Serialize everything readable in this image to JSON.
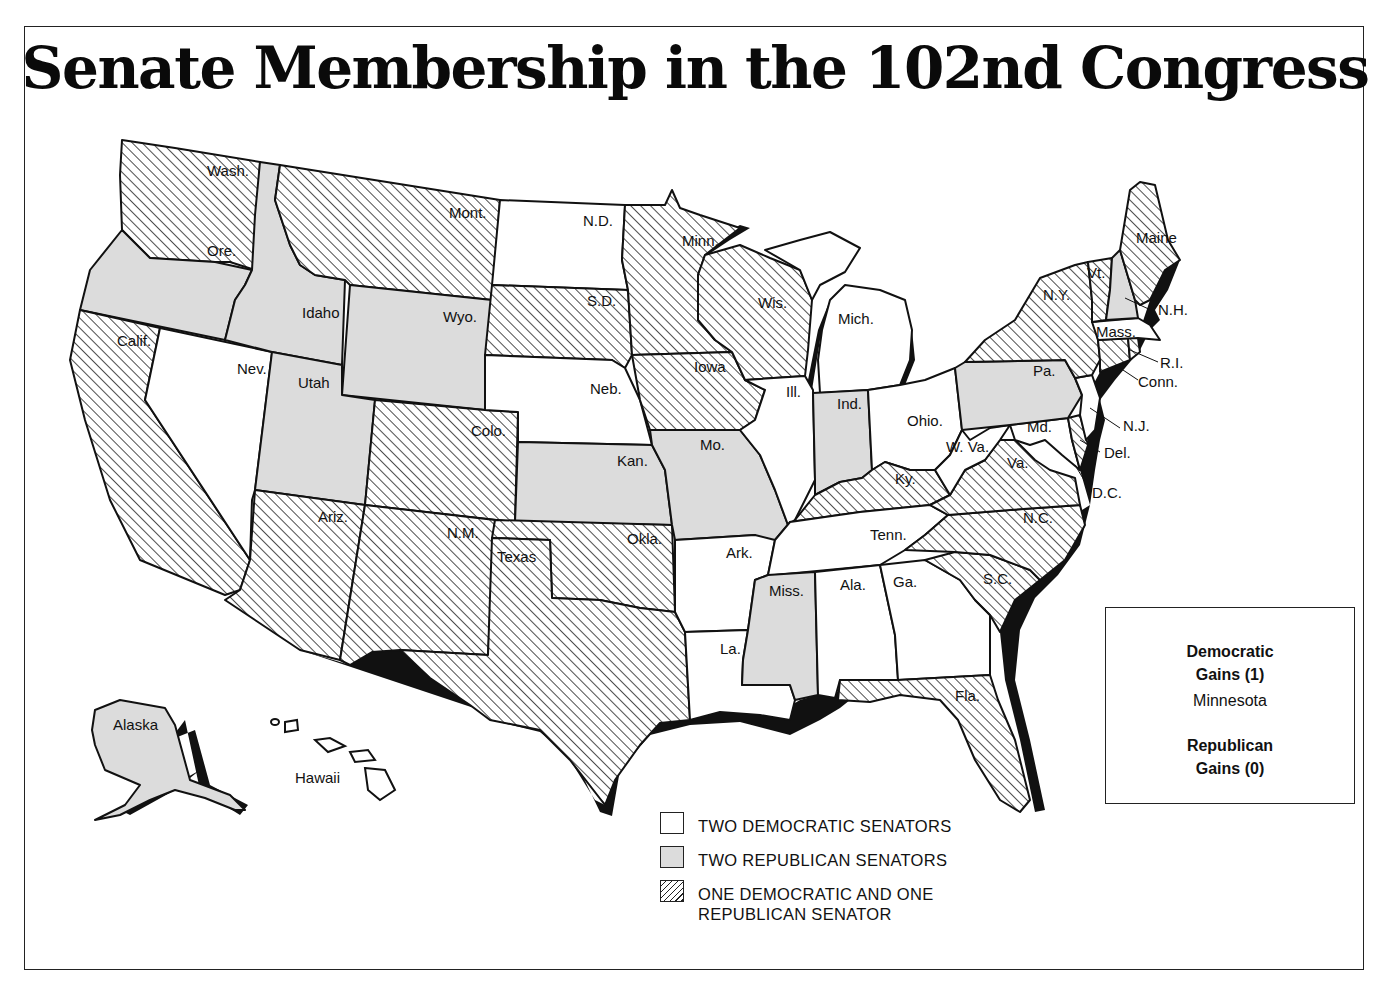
{
  "title": "Senate Membership in the 102nd Congress",
  "legend": {
    "items": [
      {
        "key": "two_dem",
        "label": "TWO DEMOCRATIC SENATORS",
        "fill": "white"
      },
      {
        "key": "two_rep",
        "label": "TWO REPUBLICAN SENATORS",
        "fill": "#dcdcdc"
      },
      {
        "key": "split",
        "label_line1": "ONE DEMOCRATIC AND ONE",
        "label_line2": "REPUBLICAN SENATOR",
        "fill": "hatched"
      }
    ]
  },
  "gains": {
    "democratic_heading_1": "Democratic",
    "democratic_heading_2": "Gains (1)",
    "democratic_states": "Minnesota",
    "republican_heading_1": "Republican",
    "republican_heading_2": "Gains (0)"
  },
  "colors": {
    "two_dem": "#ffffff",
    "two_rep": "#dcdcdc",
    "split_hatch": "#222222",
    "outline": "#111111"
  },
  "states": [
    {
      "abbr": "Wash.",
      "status": "split"
    },
    {
      "abbr": "Ore.",
      "status": "two_rep"
    },
    {
      "abbr": "Calif.",
      "status": "split"
    },
    {
      "abbr": "Nev.",
      "status": "two_dem"
    },
    {
      "abbr": "Idaho",
      "status": "two_rep"
    },
    {
      "abbr": "Mont.",
      "status": "split"
    },
    {
      "abbr": "Wyo.",
      "status": "two_rep"
    },
    {
      "abbr": "Utah",
      "status": "two_rep"
    },
    {
      "abbr": "Colo.",
      "status": "split"
    },
    {
      "abbr": "Ariz.",
      "status": "split"
    },
    {
      "abbr": "N.M.",
      "status": "split"
    },
    {
      "abbr": "N.D.",
      "status": "two_dem"
    },
    {
      "abbr": "S.D.",
      "status": "split"
    },
    {
      "abbr": "Neb.",
      "status": "two_dem"
    },
    {
      "abbr": "Kan.",
      "status": "two_rep"
    },
    {
      "abbr": "Okla.",
      "status": "split"
    },
    {
      "abbr": "Texas",
      "status": "split"
    },
    {
      "abbr": "Minn.",
      "status": "split"
    },
    {
      "abbr": "Iowa",
      "status": "split"
    },
    {
      "abbr": "Mo.",
      "status": "two_rep"
    },
    {
      "abbr": "Ark.",
      "status": "two_dem"
    },
    {
      "abbr": "La.",
      "status": "two_dem"
    },
    {
      "abbr": "Wis.",
      "status": "split"
    },
    {
      "abbr": "Ill.",
      "status": "two_dem"
    },
    {
      "abbr": "Mich.",
      "status": "two_dem"
    },
    {
      "abbr": "Ind.",
      "status": "two_rep"
    },
    {
      "abbr": "Ohio.",
      "status": "two_dem"
    },
    {
      "abbr": "Ky.",
      "status": "split"
    },
    {
      "abbr": "Tenn.",
      "status": "two_dem"
    },
    {
      "abbr": "Miss.",
      "status": "two_rep"
    },
    {
      "abbr": "Ala.",
      "status": "two_dem"
    },
    {
      "abbr": "Ga.",
      "status": "two_dem"
    },
    {
      "abbr": "Fla.",
      "status": "split"
    },
    {
      "abbr": "S.C.",
      "status": "split"
    },
    {
      "abbr": "N.C.",
      "status": "split"
    },
    {
      "abbr": "Va.",
      "status": "split"
    },
    {
      "abbr": "W. Va.",
      "status": "two_dem"
    },
    {
      "abbr": "Md.",
      "status": "two_dem"
    },
    {
      "abbr": "Del.",
      "status": "split"
    },
    {
      "abbr": "D.C.",
      "status": "none"
    },
    {
      "abbr": "Pa.",
      "status": "two_rep"
    },
    {
      "abbr": "N.J.",
      "status": "two_dem"
    },
    {
      "abbr": "N.Y.",
      "status": "split"
    },
    {
      "abbr": "Conn.",
      "status": "split"
    },
    {
      "abbr": "R.I.",
      "status": "split"
    },
    {
      "abbr": "Mass.",
      "status": "two_dem"
    },
    {
      "abbr": "Vt.",
      "status": "split"
    },
    {
      "abbr": "N.H.",
      "status": "two_rep"
    },
    {
      "abbr": "Maine",
      "status": "split"
    },
    {
      "abbr": "Alaska",
      "status": "two_rep"
    },
    {
      "abbr": "Hawaii",
      "status": "two_dem"
    }
  ]
}
